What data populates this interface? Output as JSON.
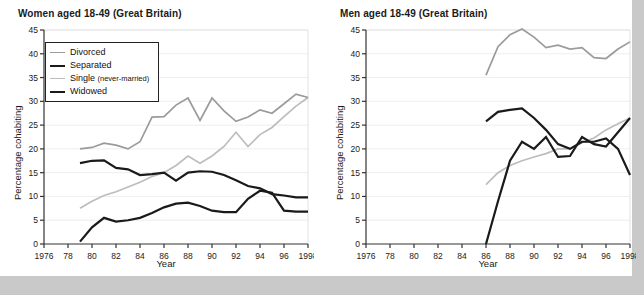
{
  "page": {
    "background_color": "#c9c9c9",
    "paper_color": "#ffffff"
  },
  "colors": {
    "divorced": "#9b9b9b",
    "separated": "#1a1a1a",
    "single": "#bdbdbd",
    "widowed": "#1a1a1a",
    "axis": "#333333",
    "grid": "#eeeeee"
  },
  "legend": {
    "items": [
      {
        "label": "Divorced",
        "sub": "",
        "color_key": "divorced",
        "width": 1.6
      },
      {
        "label": "Separated",
        "sub": "",
        "color_key": "separated",
        "width": 2.4
      },
      {
        "label": "Single ",
        "sub": "(never-married)",
        "color_key": "single",
        "width": 1.6
      },
      {
        "label": "Widowed",
        "sub": "",
        "color_key": "widowed",
        "width": 2.4
      }
    ]
  },
  "axis": {
    "ylabel": "Percentage cohabiting",
    "xlabel": "Year",
    "yticks": [
      0,
      5,
      10,
      15,
      20,
      25,
      30,
      35,
      40,
      45
    ],
    "ylim": [
      0,
      45
    ],
    "xlim": [
      1976,
      1998
    ],
    "xticks": [
      1976,
      1978,
      1980,
      1982,
      1984,
      1986,
      1988,
      1990,
      1992,
      1994,
      1996,
      1998
    ],
    "xticklabels": [
      "1976",
      "78",
      "80",
      "82",
      "84",
      "86",
      "88",
      "90",
      "92",
      "94",
      "96",
      "1998"
    ]
  },
  "chart_data": [
    {
      "type": "line",
      "title": "Women aged 18-49 (Great Britain)",
      "xlabel": "Year",
      "ylabel": "Percentage cohabiting",
      "xlim": [
        1976,
        1998
      ],
      "ylim": [
        0,
        45
      ],
      "grid": true,
      "legend_position": "upper-left",
      "x": [
        1979,
        1980,
        1981,
        1982,
        1983,
        1984,
        1985,
        1986,
        1987,
        1988,
        1989,
        1990,
        1991,
        1992,
        1993,
        1994,
        1995,
        1996,
        1997,
        1998
      ],
      "series": [
        {
          "name": "Divorced",
          "color": "#9b9b9b",
          "x": [
            1979,
            1980,
            1981,
            1982,
            1983,
            1984,
            1985,
            1986,
            1987,
            1988,
            1989,
            1990,
            1991,
            1992,
            1993,
            1994,
            1995,
            1996,
            1997,
            1998
          ],
          "values": [
            20.0,
            20.3,
            21.2,
            20.8,
            20.0,
            21.5,
            26.7,
            26.8,
            29.2,
            30.7,
            26.0,
            30.7,
            28.0,
            25.8,
            26.7,
            28.2,
            27.5,
            29.5,
            31.5,
            30.8
          ]
        },
        {
          "name": "Separated",
          "color": "#1a1a1a",
          "x": [
            1979,
            1980,
            1981,
            1982,
            1983,
            1984,
            1985,
            1986,
            1987,
            1988,
            1989,
            1990,
            1991,
            1992,
            1993,
            1994,
            1995,
            1996,
            1997,
            1998
          ],
          "values": [
            17.0,
            17.5,
            17.6,
            16.0,
            15.7,
            14.5,
            14.7,
            15.0,
            13.3,
            15.0,
            15.3,
            15.2,
            14.5,
            13.4,
            12.2,
            11.7,
            10.5,
            10.2,
            9.8,
            9.8
          ]
        },
        {
          "name": "Single (never-married)",
          "color": "#bdbdbd",
          "x": [
            1979,
            1980,
            1981,
            1982,
            1983,
            1984,
            1985,
            1986,
            1987,
            1988,
            1989,
            1990,
            1991,
            1992,
            1993,
            1994,
            1995,
            1996,
            1997,
            1998
          ],
          "values": [
            7.5,
            9.0,
            10.2,
            11.0,
            12.0,
            13.0,
            14.2,
            15.0,
            16.5,
            18.5,
            17.0,
            18.5,
            20.5,
            23.5,
            20.5,
            23.0,
            24.5,
            26.8,
            29.0,
            30.8
          ]
        },
        {
          "name": "Widowed",
          "color": "#1a1a1a",
          "x": [
            1979,
            1980,
            1981,
            1982,
            1983,
            1984,
            1985,
            1986,
            1987,
            1988,
            1989,
            1990,
            1991,
            1992,
            1993,
            1994,
            1995,
            1996,
            1997,
            1998
          ],
          "values": [
            0.5,
            3.5,
            5.5,
            4.7,
            5.0,
            5.5,
            6.5,
            7.7,
            8.5,
            8.7,
            8.0,
            7.0,
            6.7,
            6.7,
            9.5,
            11.2,
            10.8,
            7.0,
            6.8,
            6.8
          ]
        }
      ]
    },
    {
      "type": "line",
      "title": "Men aged 18-49 (Great Britain)",
      "xlabel": "Year",
      "ylabel": "Percentage cohabiting",
      "xlim": [
        1976,
        1998
      ],
      "ylim": [
        0,
        45
      ],
      "grid": true,
      "legend_position": "upper-left",
      "x": [
        1986,
        1987,
        1988,
        1989,
        1990,
        1991,
        1992,
        1993,
        1994,
        1995,
        1996,
        1997,
        1998
      ],
      "series": [
        {
          "name": "Divorced",
          "color": "#9b9b9b",
          "x": [
            1986,
            1987,
            1988,
            1989,
            1990,
            1991,
            1992,
            1993,
            1994,
            1995,
            1996,
            1997,
            1998
          ],
          "values": [
            35.5,
            41.5,
            44.0,
            45.2,
            43.5,
            41.3,
            41.8,
            41.0,
            41.3,
            39.2,
            39.0,
            41.0,
            42.5
          ]
        },
        {
          "name": "Separated",
          "color": "#1a1a1a",
          "x": [
            1986,
            1987,
            1988,
            1989,
            1990,
            1991,
            1992,
            1993,
            1994,
            1995,
            1996,
            1997,
            1998
          ],
          "values": [
            25.8,
            27.8,
            28.2,
            28.5,
            26.5,
            24.0,
            21.0,
            20.0,
            21.5,
            21.5,
            22.2,
            20.0,
            14.5
          ]
        },
        {
          "name": "Single (never-married)",
          "color": "#bdbdbd",
          "x": [
            1986,
            1987,
            1988,
            1989,
            1990,
            1991,
            1992,
            1993,
            1994,
            1995,
            1996,
            1997,
            1998
          ],
          "values": [
            12.5,
            15.0,
            16.5,
            17.5,
            18.3,
            19.0,
            20.0,
            20.0,
            21.3,
            22.3,
            24.0,
            25.3,
            26.5
          ]
        },
        {
          "name": "Widowed",
          "color": "#1a1a1a",
          "x": [
            1986,
            1987,
            1988,
            1989,
            1990,
            1991,
            1992,
            1993,
            1994,
            1995,
            1996,
            1997,
            1998
          ],
          "values": [
            0.0,
            9.0,
            17.5,
            21.5,
            20.0,
            22.5,
            18.3,
            18.5,
            22.5,
            21.0,
            20.5,
            23.5,
            26.5
          ]
        }
      ]
    }
  ]
}
